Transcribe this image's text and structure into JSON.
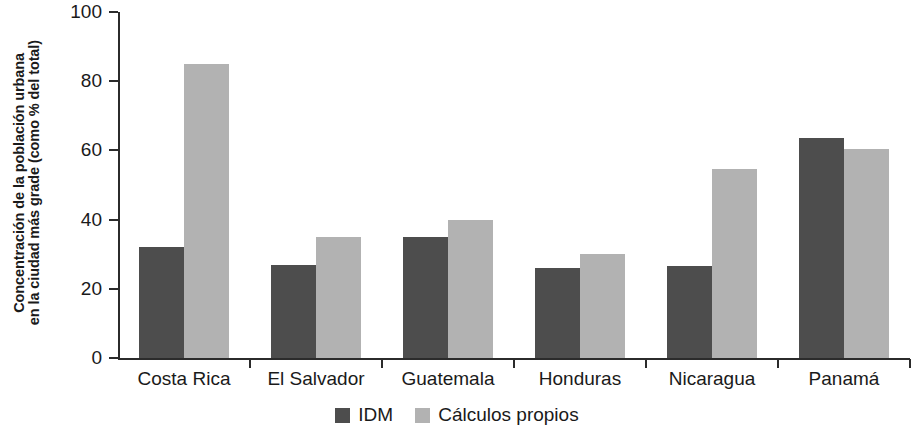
{
  "chart_data": {
    "type": "bar",
    "title": "",
    "subtitle": "",
    "xlabel": "",
    "ylabel": "Concentración de la población urbana en la ciudad más grade (como % del total)",
    "ylabel_lines": [
      "Concentración de la población urbana",
      "en la ciudad más grade (como % del total)"
    ],
    "categories": [
      "Costa Rica",
      "El Salvador",
      "Guatemala",
      "Honduras",
      "Nicaragua",
      "Panamá"
    ],
    "series": [
      {
        "name": "IDM",
        "color": "#4d4d4d",
        "values": [
          32,
          27,
          35,
          26,
          26.5,
          63.5
        ]
      },
      {
        "name": "Cálculos propios",
        "color": "#b2b2b2",
        "values": [
          85,
          35,
          40,
          30,
          54.5,
          60.5
        ]
      }
    ],
    "ylim": [
      0,
      100
    ],
    "yticks": [
      0,
      20,
      40,
      60,
      80,
      100
    ],
    "ytick_labels": [
      "0",
      "20",
      "40",
      "60",
      "80",
      "100"
    ],
    "grid": false,
    "legend_position": "bottom-center",
    "axis_color": "#2b2b2b",
    "text_color": "#1a1a1a",
    "background": "#ffffff"
  },
  "legend": {
    "items": [
      {
        "label": "IDM",
        "swatch": "dark"
      },
      {
        "label": "Cálculos propios",
        "swatch": "light"
      }
    ]
  }
}
